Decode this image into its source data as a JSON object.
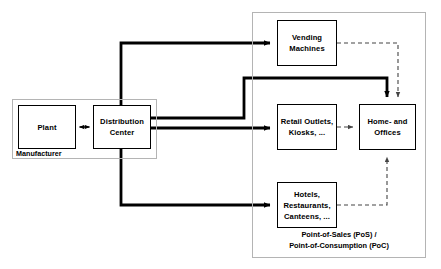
{
  "diagram": {
    "colors": {
      "node_border": "#000000",
      "group_border": "#b4b4b4",
      "flow_line": "#000000",
      "information_line": "#555555",
      "background": "#ffffff"
    }
  },
  "groups": {
    "manufacturer": {
      "label": "Manufacturer"
    },
    "pos_poc": {
      "caption_line1": "Point-of-Sales (PoS) /",
      "caption_line2": "Point-of-Consumption (PoC)"
    }
  },
  "nodes": {
    "plant": {
      "label": "Plant"
    },
    "distribution_center": {
      "line1": "Distribution",
      "line2": "Center"
    },
    "vending_machines": {
      "line1": "Vending",
      "line2": "Machines"
    },
    "retail_outlets": {
      "line1": "Retail Outlets,",
      "line2": "Kiosks, ..."
    },
    "hotels_restaurants": {
      "line1": "Hotels,",
      "line2": "Restaurants,",
      "line3": "Canteens, ..."
    },
    "home_offices": {
      "line1": "Home- and",
      "line2": "Offices"
    }
  },
  "edges": [
    {
      "id": "plant-dc",
      "from": "plant",
      "to": "distribution_center",
      "style": "solid-thin",
      "arrows": "both"
    },
    {
      "id": "dc-vending",
      "from": "distribution_center",
      "to": "vending_machines",
      "style": "solid-thick",
      "arrows": "end"
    },
    {
      "id": "dc-home",
      "from": "distribution_center",
      "to": "home_offices",
      "style": "solid-thick",
      "arrows": "end"
    },
    {
      "id": "dc-retail",
      "from": "distribution_center",
      "to": "retail_outlets",
      "style": "solid-thick",
      "arrows": "end"
    },
    {
      "id": "dc-hotels",
      "from": "distribution_center",
      "to": "hotels_restaurants",
      "style": "solid-thick",
      "arrows": "end"
    },
    {
      "id": "vending-home",
      "from": "vending_machines",
      "to": "home_offices",
      "style": "dashed",
      "arrows": "end"
    },
    {
      "id": "retail-home",
      "from": "retail_outlets",
      "to": "home_offices",
      "style": "dashed",
      "arrows": "end"
    },
    {
      "id": "hotels-home",
      "from": "hotels_restaurants",
      "to": "home_offices",
      "style": "dashed",
      "arrows": "end"
    }
  ]
}
